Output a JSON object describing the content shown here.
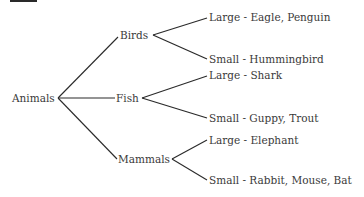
{
  "diagram": {
    "root": {
      "label": "Animals"
    },
    "categories": [
      {
        "label": "Birds",
        "children": [
          {
            "label": "Large - Eagle,  Penguin"
          },
          {
            "label": "Small - Hummingbird"
          }
        ]
      },
      {
        "label": "Fish",
        "children": [
          {
            "label": "Large - Shark"
          },
          {
            "label": "Small - Guppy,  Trout"
          }
        ]
      },
      {
        "label": "Mammals",
        "children": [
          {
            "label": "Large - Elephant"
          },
          {
            "label": "Small - Rabbit,  Mouse,  Bat"
          }
        ]
      }
    ],
    "line_color": "#2a2a2a",
    "text_color": "#3a3a3a"
  }
}
